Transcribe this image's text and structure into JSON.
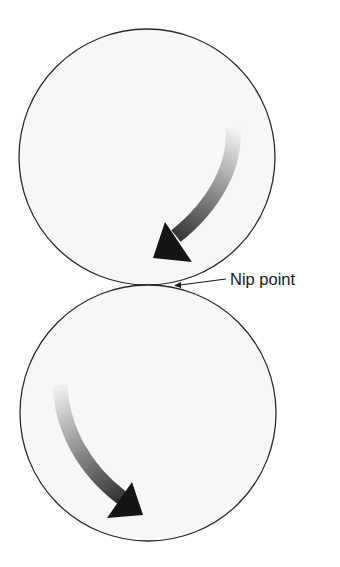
{
  "diagram": {
    "type": "nip-rollers",
    "label": "Nip point",
    "rollers": [
      {
        "name": "top-roller",
        "rotation": "clockwise"
      },
      {
        "name": "bottom-roller",
        "rotation": "counterclockwise"
      }
    ],
    "colors": {
      "roller_fill": "#f7f7f7",
      "roller_stroke": "#2a2a2a",
      "arrow_dark": "#151515",
      "arrow_light": "#e8e8e8"
    }
  }
}
